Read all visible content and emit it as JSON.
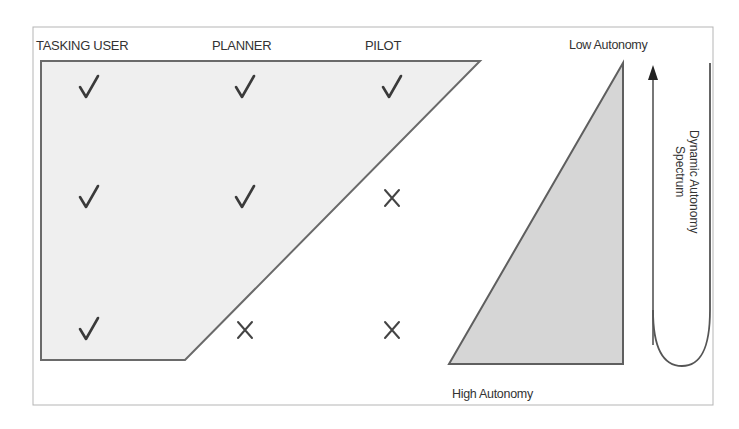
{
  "diagram": {
    "columns": [
      {
        "label": "TASKING USER"
      },
      {
        "label": "PLANNER"
      },
      {
        "label": "PILOT"
      }
    ],
    "rows": [
      {
        "marks": [
          "check",
          "check",
          "check"
        ]
      },
      {
        "marks": [
          "check",
          "check",
          "x"
        ]
      },
      {
        "marks": [
          "check",
          "x",
          "x"
        ]
      }
    ],
    "autonomy": {
      "top_label": "Low Autonomy",
      "bottom_label": "High Autonomy"
    },
    "spectrum": {
      "line1": "Dynamic Autonomy",
      "line2": "Spectrum",
      "arrow_direction": "up"
    },
    "icons": {
      "check": "check-mark-icon",
      "x": "x-mark-icon",
      "arrow": "arrow-up-icon"
    },
    "colors": {
      "shape_fill": "#efefef",
      "triangle_fill": "#d6d6d6",
      "stroke": "#5f5f5f",
      "text": "#333333"
    }
  }
}
